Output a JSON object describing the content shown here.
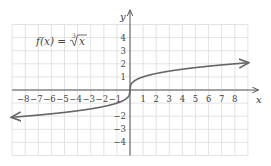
{
  "chart_data": {
    "type": "line",
    "title_parts": {
      "lhs": "f(x) =",
      "index": "3",
      "radicand": "x"
    },
    "xlabel": "x",
    "ylabel": "y",
    "xlim": [
      -9,
      9
    ],
    "ylim": [
      -5,
      5
    ],
    "grid": true,
    "x_ticks": [
      -8,
      -7,
      -6,
      -5,
      -4,
      -3,
      -2,
      -1,
      1,
      2,
      3,
      4,
      5,
      6,
      7,
      8
    ],
    "x_tick_labels": [
      "−8",
      "−7",
      "−6",
      "−5",
      "−4",
      "−3",
      "−2",
      "−1",
      "1",
      "2",
      "3",
      "4",
      "5",
      "6",
      "7",
      "8"
    ],
    "y_ticks": [
      4,
      3,
      2,
      1,
      -2,
      -3,
      -4
    ],
    "y_tick_labels": [
      "4",
      "3",
      "2",
      "1",
      "−2",
      "−3",
      "−4"
    ],
    "series": [
      {
        "name": "f(x) = ∛x",
        "function": "cbrt",
        "x": [
          -9,
          -8,
          -1,
          0,
          1,
          8,
          9
        ],
        "values": [
          -2.08,
          -2,
          -1,
          0,
          1,
          2,
          2.08
        ],
        "arrows": "both",
        "color": "#666666"
      }
    ]
  },
  "layout_px": {
    "origin_x": 130,
    "origin_y": 90,
    "unit_x": 13.1,
    "unit_y": 13.1
  }
}
